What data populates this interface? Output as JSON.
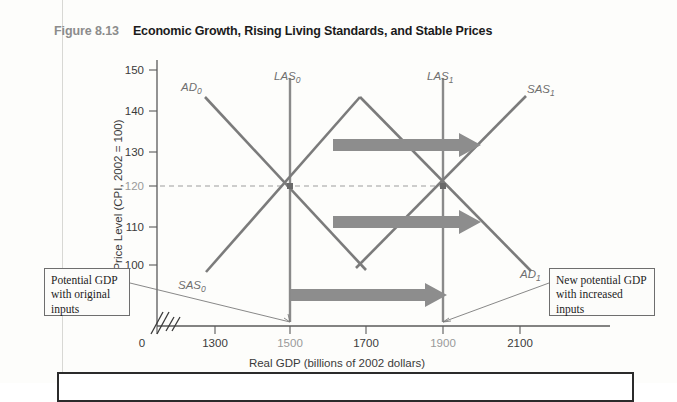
{
  "figure": {
    "number": "Figure 8.13",
    "title": "Economic Growth, Rising Living Standards, and Stable Prices"
  },
  "chart_data": {
    "type": "line",
    "title": "Economic Growth, Rising Living Standards, and Stable Prices",
    "xlabel": "Real GDP (billions of 2002 dollars)",
    "ylabel": "Price Level (CPI, 2002 = 100)",
    "xlim": [
      1200,
      2200
    ],
    "ylim": [
      95,
      152
    ],
    "xticks": [
      0,
      1300,
      1500,
      1700,
      1900,
      2100
    ],
    "xtick_labels": [
      "0",
      "1300",
      "1500",
      "1700",
      "1900",
      "2100"
    ],
    "highlighted_xticks": [
      "1500",
      "1900"
    ],
    "yticks": [
      100,
      110,
      120,
      130,
      140,
      150
    ],
    "ytick_labels": [
      "100",
      "110",
      "120",
      "130",
      "140",
      "150"
    ],
    "highlighted_yticks": [
      "120"
    ],
    "grid": false,
    "axis_break": true,
    "legend": "inline curve labels",
    "equilibria": [
      {
        "label": "initial equilibrium",
        "real_gdp": 1500,
        "price_level": 120
      },
      {
        "label": "new equilibrium",
        "real_gdp": 1900,
        "price_level": 120
      }
    ],
    "series": [
      {
        "name": "AD_0",
        "label": "AD",
        "subscript": "0",
        "kind": "aggregate-demand",
        "points": [
          [
            1313,
            143
          ],
          [
            1700,
            99
          ]
        ]
      },
      {
        "name": "SAS_0",
        "label": "SAS",
        "subscript": "0",
        "kind": "short-run-aggregate-supply",
        "points": [
          [
            1315,
            99
          ],
          [
            1700,
            144
          ]
        ]
      },
      {
        "name": "LAS_0",
        "label": "LAS",
        "subscript": "0",
        "kind": "long-run-aggregate-supply",
        "real_gdp": 1500,
        "points": [
          [
            1500,
            148
          ],
          [
            1500,
            97
          ]
        ]
      },
      {
        "name": "AD_1",
        "label": "AD",
        "subscript": "1",
        "kind": "aggregate-demand",
        "points": [
          [
            1700,
            144
          ],
          [
            2105,
            99
          ]
        ]
      },
      {
        "name": "SAS_1",
        "label": "SAS",
        "subscript": "1",
        "kind": "short-run-aggregate-supply",
        "points": [
          [
            1700,
            99
          ],
          [
            2090,
            143
          ]
        ]
      },
      {
        "name": "LAS_1",
        "label": "LAS",
        "subscript": "1",
        "kind": "long-run-aggregate-supply",
        "real_gdp": 1900,
        "points": [
          [
            1900,
            148
          ],
          [
            1900,
            97
          ]
        ]
      }
    ],
    "shift_arrows": [
      {
        "name": "sas-shift-arrow",
        "from_gdp": 1655,
        "to_gdp": 1960,
        "price_level": 131,
        "meaning": "SAS shifts rightward"
      },
      {
        "name": "ad-shift-arrow",
        "from_gdp": 1655,
        "to_gdp": 1960,
        "price_level": 110,
        "meaning": "AD shifts rightward"
      },
      {
        "name": "las-shift-arrow",
        "from_gdp": 1500,
        "to_gdp": 1905,
        "price_level": 101,
        "meaning": "LAS shifts rightward"
      }
    ],
    "reference_line": {
      "type": "horizontal-dashed",
      "price_level": 120,
      "from_gdp": 1300,
      "to_gdp": 1900
    }
  },
  "curve_labels": [
    {
      "name": "ad0",
      "base": "AD",
      "sub": "0"
    },
    {
      "name": "las0",
      "base": "LAS",
      "sub": "0"
    },
    {
      "name": "las1",
      "base": "LAS",
      "sub": "1"
    },
    {
      "name": "sas1",
      "base": "SAS",
      "sub": "1"
    },
    {
      "name": "sas0",
      "base": "SAS",
      "sub": "0"
    },
    {
      "name": "ad1",
      "base": "AD",
      "sub": "1"
    }
  ],
  "callouts": {
    "left": "Potential GDP with original inputs",
    "right": "New potential GDP with increased inputs"
  },
  "colors": {
    "curve": "#7b7b7b",
    "arrow": "#8d8d8d",
    "axis": "#5a5a5a",
    "title": "#1b1b1b",
    "figure_number": "#8c8c8c"
  }
}
